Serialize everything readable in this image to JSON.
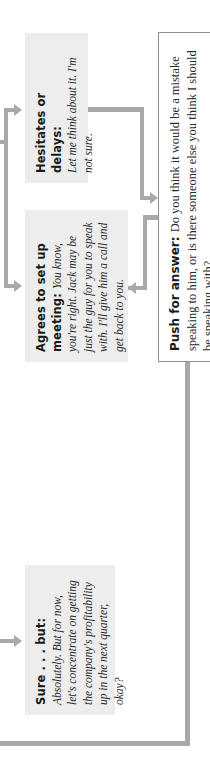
{
  "diagram": {
    "orientation": "rotated 90deg counter-clockwise",
    "colors": {
      "connector": "#a9a9a9",
      "response_box_bg": "#ededed",
      "push_box_border": "#8f8f8f",
      "text": "#2a2a2a"
    },
    "responses": [
      {
        "id": "sure-but",
        "heading": "Sure . . . but:",
        "body": "Absolutely. But for now, let's concentrate on getting the company's profitability up in the next quarter, okay?"
      },
      {
        "id": "agrees",
        "heading": "Agrees to set up meeting:",
        "body": "You know, you're right. Jack may be just the guy for you to speak with. I'll give him a call and get back to you."
      },
      {
        "id": "hesitates",
        "heading": "Hesitates or delays:",
        "body": "Let me think about it. I'm not sure."
      }
    ],
    "push": {
      "heading": "Push for answer:",
      "body": "Do you think it would be a mistake speaking to him, or is there someone else you think I should be speaking with?"
    }
  }
}
